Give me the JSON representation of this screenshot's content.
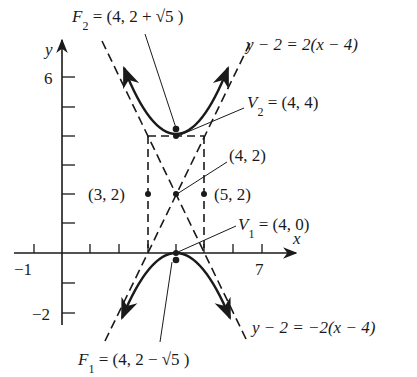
{
  "figure": {
    "type": "hyperbola-diagram",
    "equation": "(y-2)^2/4 - (x-4)^2 = 1",
    "axes": {
      "x_label": "x",
      "y_label": "y",
      "x_tick_labels": {
        "neg1": "−1",
        "seven": "7"
      },
      "y_tick_labels": {
        "six": "6",
        "neg2": "−2"
      },
      "x_range": [
        -1,
        7
      ],
      "y_range": [
        -2,
        6
      ]
    },
    "labels": {
      "F2": {
        "name": "F",
        "sub": "2",
        "value": " = (4, 2 + √5 )"
      },
      "F1": {
        "name": "F",
        "sub": "1",
        "value": " = (4, 2 − √5 )"
      },
      "V2": {
        "name": "V",
        "sub": "2",
        "value": " = (4, 4)"
      },
      "V1": {
        "name": "V",
        "sub": "1",
        "value": " = (4, 0)"
      },
      "center": "(4, 2)",
      "left_point": "(3, 2)",
      "right_point": "(5, 2)",
      "asymptote_pos": "y − 2 = 2(x − 4)",
      "asymptote_neg": "y − 2 = −2(x − 4)"
    },
    "points": [
      {
        "name": "F2",
        "x": 4,
        "y": 4.236
      },
      {
        "name": "V2",
        "x": 4,
        "y": 4
      },
      {
        "name": "center",
        "x": 4,
        "y": 2
      },
      {
        "name": "left",
        "x": 3,
        "y": 2
      },
      {
        "name": "right",
        "x": 5,
        "y": 2
      },
      {
        "name": "V1",
        "x": 4,
        "y": 0
      },
      {
        "name": "F1",
        "x": 4,
        "y": -0.236
      }
    ]
  }
}
